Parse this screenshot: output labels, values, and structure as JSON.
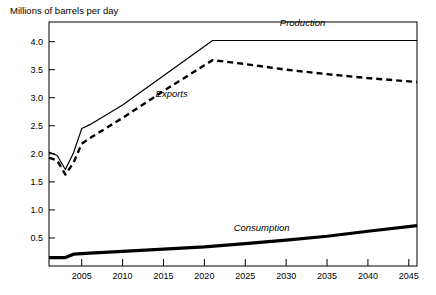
{
  "chart_data": {
    "type": "line",
    "title": "Millions of barrels per day",
    "xlabel": "",
    "ylabel": "Millions of barrels per day",
    "xlim": [
      2001,
      2046
    ],
    "ylim": [
      0,
      4.35
    ],
    "grid": false,
    "legend_position": "inline-labels",
    "x_ticks": [
      2005,
      2010,
      2015,
      2020,
      2025,
      2030,
      2035,
      2040,
      2045
    ],
    "y_ticks": [
      0.5,
      1.0,
      1.5,
      2.0,
      2.5,
      3.0,
      3.5,
      4.0
    ],
    "y_tick_labels": [
      "0.5",
      "1.0",
      "1.5",
      "2.0",
      "2.5",
      "3.0",
      "3.5",
      "4.0"
    ],
    "x_tick_labels": [
      "2005",
      "2010",
      "2015",
      "2020",
      "2025",
      "2030",
      "2035",
      "2040",
      "2045"
    ],
    "series": [
      {
        "name": "Production",
        "style": "solid",
        "width": 1.2,
        "color": "#000000",
        "label": "Production",
        "label_x": 2032,
        "label_y": 4.28,
        "x": [
          2001,
          2002,
          2003,
          2004,
          2005,
          2006,
          2010,
          2015,
          2021,
          2025,
          2030,
          2035,
          2040,
          2046
        ],
        "y": [
          2.03,
          1.97,
          1.72,
          2.02,
          2.45,
          2.52,
          2.87,
          3.39,
          4.02,
          4.02,
          4.02,
          4.02,
          4.02,
          4.02
        ]
      },
      {
        "name": "Exports",
        "style": "dashed",
        "width": 2.4,
        "color": "#000000",
        "label": "Exports",
        "label_x": 2016,
        "label_y": 3.02,
        "x": [
          2001,
          2002,
          2003,
          2004,
          2005,
          2006,
          2010,
          2015,
          2021,
          2025,
          2030,
          2035,
          2040,
          2046
        ],
        "y": [
          1.93,
          1.88,
          1.63,
          1.84,
          2.18,
          2.28,
          2.64,
          3.12,
          3.67,
          3.6,
          3.5,
          3.42,
          3.35,
          3.28
        ]
      },
      {
        "name": "Consumption",
        "style": "solid",
        "width": 3.2,
        "color": "#000000",
        "label": "Consumption",
        "label_x": 2027,
        "label_y": 0.62,
        "x": [
          2001,
          2003,
          2004,
          2006,
          2010,
          2015,
          2020,
          2025,
          2030,
          2035,
          2040,
          2046
        ],
        "y": [
          0.15,
          0.15,
          0.21,
          0.23,
          0.26,
          0.3,
          0.34,
          0.4,
          0.46,
          0.53,
          0.62,
          0.72
        ]
      }
    ]
  },
  "geometry": {
    "plot_left": 49,
    "plot_right": 417,
    "plot_top": 22,
    "plot_bottom": 266
  }
}
